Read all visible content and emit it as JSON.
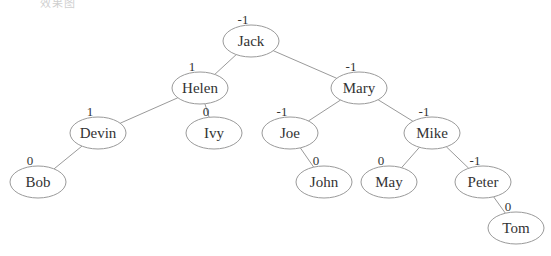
{
  "header": {
    "cut_off_text": "效果图"
  },
  "tree": {
    "nodes": [
      {
        "id": "jack",
        "label": "Jack",
        "bf": "-1",
        "x": 251,
        "y": 41
      },
      {
        "id": "helen",
        "label": "Helen",
        "bf": "1",
        "x": 200,
        "y": 88
      },
      {
        "id": "mary",
        "label": "Mary",
        "bf": "-1",
        "x": 359,
        "y": 88
      },
      {
        "id": "devin",
        "label": "Devin",
        "bf": "1",
        "x": 98,
        "y": 133
      },
      {
        "id": "ivy",
        "label": "Ivy",
        "bf": "0",
        "x": 214,
        "y": 133
      },
      {
        "id": "joe",
        "label": "Joe",
        "bf": "-1",
        "x": 290,
        "y": 133
      },
      {
        "id": "mike",
        "label": "Mike",
        "bf": "-1",
        "x": 432,
        "y": 133
      },
      {
        "id": "bob",
        "label": "Bob",
        "bf": "0",
        "x": 38,
        "y": 182
      },
      {
        "id": "john",
        "label": "John",
        "bf": "0",
        "x": 324,
        "y": 182
      },
      {
        "id": "may",
        "label": "May",
        "bf": "0",
        "x": 389,
        "y": 182
      },
      {
        "id": "peter",
        "label": "Peter",
        "bf": "-1",
        "x": 483,
        "y": 182
      },
      {
        "id": "tom",
        "label": "Tom",
        "bf": "0",
        "x": 516,
        "y": 228
      }
    ],
    "edges": [
      [
        "jack",
        "helen"
      ],
      [
        "jack",
        "mary"
      ],
      [
        "helen",
        "devin"
      ],
      [
        "helen",
        "ivy"
      ],
      [
        "mary",
        "joe"
      ],
      [
        "mary",
        "mike"
      ],
      [
        "devin",
        "bob"
      ],
      [
        "joe",
        "john"
      ],
      [
        "mike",
        "may"
      ],
      [
        "mike",
        "peter"
      ],
      [
        "peter",
        "tom"
      ]
    ]
  }
}
